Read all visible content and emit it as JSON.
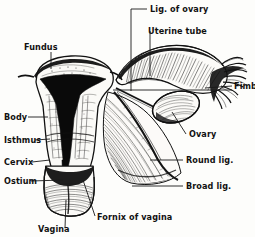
{
  "figure": {
    "style": "black-and-white engraving / line drawing",
    "background_color": "#fdfdfb",
    "ink_color": "#111111"
  },
  "labels": {
    "lig_of_ovary": "Lig. of ovary",
    "uterine_tube": "Uterine tube",
    "fimbriae": "Fimbriae",
    "ovary": "Ovary",
    "round_lig": "Round lig.",
    "broad_lig": "Broad lig.",
    "fundus": "Fundus",
    "body": "Body",
    "isthmus": "Isthmus",
    "cervix": "Cervix",
    "ostium": "Ostium",
    "vagina": "Vagina",
    "fornix_of_vagina": "Fornix of vagina"
  }
}
